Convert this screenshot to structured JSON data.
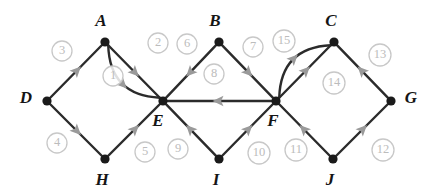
{
  "figure": {
    "kind": "directed-graph-diagram",
    "background_color": "#ffffff",
    "vertex_color": "#1a1a1a",
    "edge_color": "#2b2b2b",
    "arrow_color": "#9a9a9a",
    "label_color": "#bcbcbc",
    "vertex_label_color": "#151515"
  },
  "vertices": [
    {
      "id": "A",
      "label": "A",
      "x": 105,
      "y": 42,
      "label_x": 101,
      "label_y": 22
    },
    {
      "id": "B",
      "label": "B",
      "x": 219,
      "y": 42,
      "label_x": 215,
      "label_y": 22
    },
    {
      "id": "C",
      "label": "C",
      "x": 334,
      "y": 42,
      "label_x": 331,
      "label_y": 22
    },
    {
      "id": "D",
      "label": "D",
      "x": 47,
      "y": 101,
      "label_x": 26,
      "label_y": 99
    },
    {
      "id": "E",
      "label": "E",
      "x": 163,
      "y": 101,
      "label_x": 158,
      "label_y": 122
    },
    {
      "id": "F",
      "label": "F",
      "x": 276,
      "y": 101,
      "label_x": 273,
      "label_y": 122
    },
    {
      "id": "G",
      "label": "G",
      "x": 391,
      "y": 101,
      "label_x": 411,
      "label_y": 99
    },
    {
      "id": "H",
      "label": "H",
      "x": 105,
      "y": 159,
      "label_x": 102,
      "label_y": 181
    },
    {
      "id": "I",
      "label": "I",
      "x": 219,
      "y": 159,
      "label_x": 216,
      "label_y": 181
    },
    {
      "id": "J",
      "label": "J",
      "x": 333,
      "y": 159,
      "label_x": 330,
      "label_y": 181
    }
  ],
  "edges": [
    {
      "id": "e1",
      "label": "1",
      "from": "A",
      "to": "E",
      "shape": "straight",
      "label_x": 113,
      "label_y": 76
    },
    {
      "id": "e2",
      "label": "2",
      "from": "A",
      "to": "E",
      "shape": "curve",
      "bulge": 17,
      "label_x": 158,
      "label_y": 43
    },
    {
      "id": "e3",
      "label": "3",
      "from": "D",
      "to": "A",
      "shape": "straight",
      "label_x": 62,
      "label_y": 51
    },
    {
      "id": "e4",
      "label": "4",
      "from": "D",
      "to": "H",
      "shape": "straight",
      "label_x": 57,
      "label_y": 143
    },
    {
      "id": "e5",
      "label": "5",
      "from": "H",
      "to": "E",
      "shape": "straight",
      "label_x": 145,
      "label_y": 152
    },
    {
      "id": "e6",
      "label": "6",
      "from": "B",
      "to": "E",
      "shape": "straight",
      "label_x": 187,
      "label_y": 44
    },
    {
      "id": "e7",
      "label": "7",
      "from": "B",
      "to": "F",
      "shape": "straight",
      "label_x": 253,
      "label_y": 47
    },
    {
      "id": "e8",
      "label": "8",
      "from": "F",
      "to": "E",
      "shape": "straight",
      "label_x": 214,
      "label_y": 74
    },
    {
      "id": "e9",
      "label": "9",
      "from": "I",
      "to": "E",
      "shape": "straight",
      "label_x": 178,
      "label_y": 149
    },
    {
      "id": "e10",
      "label": "10",
      "from": "I",
      "to": "F",
      "shape": "straight",
      "label_x": 259,
      "label_y": 153
    },
    {
      "id": "e11",
      "label": "11",
      "from": "J",
      "to": "F",
      "shape": "straight",
      "label_x": 296,
      "label_y": 150
    },
    {
      "id": "e12",
      "label": "12",
      "from": "J",
      "to": "G",
      "shape": "straight",
      "label_x": 383,
      "label_y": 150
    },
    {
      "id": "e13",
      "label": "13",
      "from": "G",
      "to": "C",
      "shape": "straight",
      "label_x": 380,
      "label_y": 55
    },
    {
      "id": "e14",
      "label": "14",
      "from": "F",
      "to": "C",
      "shape": "straight",
      "label_x": 334,
      "label_y": 83
    },
    {
      "id": "e15",
      "label": "15",
      "from": "F",
      "to": "C",
      "shape": "curve",
      "bulge": -17,
      "label_x": 284,
      "label_y": 41
    }
  ]
}
